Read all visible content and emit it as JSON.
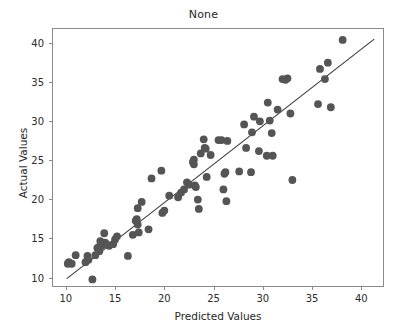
{
  "chart_data": {
    "type": "scatter",
    "title": "None",
    "xlabel": "Predicted Values",
    "ylabel": "Actual Values",
    "xlim": [
      8.6,
      42.3
    ],
    "ylim": [
      8.8,
      41.9
    ],
    "xticks": [
      10,
      15,
      20,
      25,
      30,
      35,
      40
    ],
    "yticks": [
      10,
      15,
      20,
      25,
      30,
      35,
      40
    ],
    "xtick_labels": [
      "10",
      "15",
      "20",
      "25",
      "30",
      "35",
      "40"
    ],
    "ytick_labels": [
      "10",
      "15",
      "20",
      "25",
      "30",
      "35",
      "40"
    ],
    "grid": false,
    "legend": null,
    "marker_color": "#555555",
    "marker_size": 5.2,
    "line_color": "#3a3a3a",
    "reference_line": {
      "x": [
        10.0,
        41.2
      ],
      "y": [
        10.0,
        40.6
      ]
    },
    "points": [
      {
        "x": 10.1,
        "y": 11.9
      },
      {
        "x": 10.2,
        "y": 12.1
      },
      {
        "x": 10.5,
        "y": 11.9
      },
      {
        "x": 10.9,
        "y": 13.0
      },
      {
        "x": 11.9,
        "y": 12.1
      },
      {
        "x": 12.1,
        "y": 12.9
      },
      {
        "x": 12.2,
        "y": 12.4
      },
      {
        "x": 12.6,
        "y": 9.9
      },
      {
        "x": 12.9,
        "y": 13.0
      },
      {
        "x": 13.1,
        "y": 13.9
      },
      {
        "x": 13.2,
        "y": 14.0
      },
      {
        "x": 13.3,
        "y": 13.5
      },
      {
        "x": 13.4,
        "y": 14.8
      },
      {
        "x": 13.5,
        "y": 14.2
      },
      {
        "x": 13.8,
        "y": 15.8
      },
      {
        "x": 13.9,
        "y": 14.6
      },
      {
        "x": 14.1,
        "y": 14.3
      },
      {
        "x": 14.3,
        "y": 14.2
      },
      {
        "x": 14.7,
        "y": 14.4
      },
      {
        "x": 14.9,
        "y": 15.0
      },
      {
        "x": 15.1,
        "y": 15.4
      },
      {
        "x": 16.2,
        "y": 12.9
      },
      {
        "x": 16.7,
        "y": 15.6
      },
      {
        "x": 17.0,
        "y": 17.4
      },
      {
        "x": 17.1,
        "y": 17.6
      },
      {
        "x": 17.2,
        "y": 16.9
      },
      {
        "x": 17.2,
        "y": 19.0
      },
      {
        "x": 17.3,
        "y": 15.9
      },
      {
        "x": 17.6,
        "y": 19.8
      },
      {
        "x": 18.3,
        "y": 16.3
      },
      {
        "x": 18.6,
        "y": 22.8
      },
      {
        "x": 19.6,
        "y": 23.8
      },
      {
        "x": 19.7,
        "y": 18.4
      },
      {
        "x": 19.9,
        "y": 18.7
      },
      {
        "x": 20.4,
        "y": 20.6
      },
      {
        "x": 21.3,
        "y": 20.4
      },
      {
        "x": 21.6,
        "y": 21.0
      },
      {
        "x": 21.9,
        "y": 21.4
      },
      {
        "x": 22.2,
        "y": 22.3
      },
      {
        "x": 22.4,
        "y": 22.0
      },
      {
        "x": 22.8,
        "y": 24.9
      },
      {
        "x": 22.9,
        "y": 25.2
      },
      {
        "x": 22.9,
        "y": 24.6
      },
      {
        "x": 23.0,
        "y": 21.9
      },
      {
        "x": 23.1,
        "y": 21.7
      },
      {
        "x": 23.3,
        "y": 20.1
      },
      {
        "x": 23.4,
        "y": 18.9
      },
      {
        "x": 23.6,
        "y": 26.0
      },
      {
        "x": 23.9,
        "y": 27.8
      },
      {
        "x": 24.0,
        "y": 26.7
      },
      {
        "x": 24.1,
        "y": 26.6
      },
      {
        "x": 24.2,
        "y": 23.0
      },
      {
        "x": 24.6,
        "y": 25.8
      },
      {
        "x": 25.4,
        "y": 27.7
      },
      {
        "x": 25.7,
        "y": 27.7
      },
      {
        "x": 25.9,
        "y": 21.4
      },
      {
        "x": 26.0,
        "y": 23.4
      },
      {
        "x": 26.1,
        "y": 23.6
      },
      {
        "x": 26.2,
        "y": 19.9
      },
      {
        "x": 26.3,
        "y": 27.6
      },
      {
        "x": 27.5,
        "y": 23.7
      },
      {
        "x": 28.0,
        "y": 29.7
      },
      {
        "x": 28.2,
        "y": 26.7
      },
      {
        "x": 28.7,
        "y": 23.6
      },
      {
        "x": 28.8,
        "y": 28.7
      },
      {
        "x": 29.0,
        "y": 30.7
      },
      {
        "x": 29.5,
        "y": 26.3
      },
      {
        "x": 29.6,
        "y": 30.1
      },
      {
        "x": 30.3,
        "y": 25.7
      },
      {
        "x": 30.4,
        "y": 32.5
      },
      {
        "x": 30.6,
        "y": 30.2
      },
      {
        "x": 30.8,
        "y": 28.6
      },
      {
        "x": 30.9,
        "y": 25.7
      },
      {
        "x": 31.4,
        "y": 31.6
      },
      {
        "x": 31.9,
        "y": 35.5
      },
      {
        "x": 32.2,
        "y": 35.4
      },
      {
        "x": 32.4,
        "y": 35.6
      },
      {
        "x": 32.7,
        "y": 31.1
      },
      {
        "x": 32.9,
        "y": 22.6
      },
      {
        "x": 35.5,
        "y": 32.3
      },
      {
        "x": 35.7,
        "y": 36.8
      },
      {
        "x": 36.2,
        "y": 35.5
      },
      {
        "x": 36.5,
        "y": 37.6
      },
      {
        "x": 36.8,
        "y": 31.9
      },
      {
        "x": 38.0,
        "y": 40.5
      }
    ]
  }
}
